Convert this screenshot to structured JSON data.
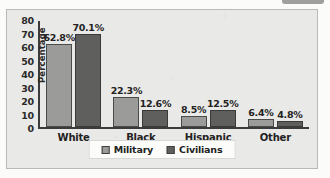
{
  "chart_data": {
    "type": "bar",
    "title": "",
    "xlabel": "",
    "ylabel": "Percentage",
    "ylim": [
      0,
      80
    ],
    "yticks": [
      "80",
      "70",
      "60",
      "50",
      "40",
      "30",
      "20",
      "10",
      "0"
    ],
    "grid": false,
    "legend_position": "bottom",
    "categories": [
      "White",
      "Black",
      "Hispanic",
      "Other"
    ],
    "series": [
      {
        "name": "Military",
        "color": "#9b9b99",
        "values": [
          62.8,
          22.3,
          8.5,
          6.4
        ],
        "labels": [
          "62.8%",
          "22.3%",
          "8.5%",
          "6.4%"
        ]
      },
      {
        "name": "Civilians",
        "color": "#5f5f5e",
        "values": [
          70.1,
          12.6,
          12.5,
          4.8
        ],
        "labels": [
          "70.1%",
          "12.6%",
          "12.5%",
          "4.8%"
        ]
      }
    ]
  }
}
